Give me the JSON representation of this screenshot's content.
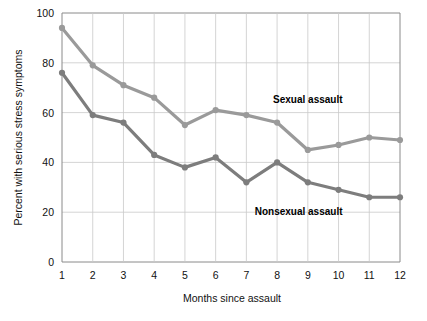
{
  "chart_data": {
    "type": "line",
    "title": "",
    "xlabel": "Months since assault",
    "ylabel": "Percent with serious stress symptoms",
    "x": [
      1,
      2,
      3,
      4,
      5,
      6,
      7,
      8,
      9,
      10,
      11,
      12
    ],
    "xtick_labels": [
      "1",
      "2",
      "3",
      "4",
      "5",
      "6",
      "7",
      "8",
      "9",
      "10",
      "11",
      "12"
    ],
    "ytick_labels": [
      "0",
      "20",
      "40",
      "60",
      "80",
      "100"
    ],
    "yticks": [
      0,
      20,
      40,
      60,
      80,
      100
    ],
    "ylim": [
      0,
      100
    ],
    "xlim": [
      1,
      12
    ],
    "grid": true,
    "legend_position": "inline-annotation",
    "series": [
      {
        "name": "Sexual assault",
        "color": "#9a9a9a",
        "label_x": 9.0,
        "label_y": 64,
        "values": [
          94,
          79,
          71,
          66,
          55,
          61,
          59,
          56,
          45,
          47,
          50,
          49
        ]
      },
      {
        "name": "Nonsexual assault",
        "color": "#7d7d7d",
        "label_x": 8.7,
        "label_y": 19,
        "values": [
          76,
          59,
          56,
          43,
          38,
          42,
          32,
          40,
          32,
          29,
          26,
          26
        ]
      }
    ]
  },
  "colors": {
    "background": "#ffffff",
    "axis": "#8a8a8a",
    "grid": "#c9c9c9",
    "text": "#111111",
    "sexual_assault": "#9a9a9a",
    "nonsexual_assault": "#7d7d7d"
  }
}
